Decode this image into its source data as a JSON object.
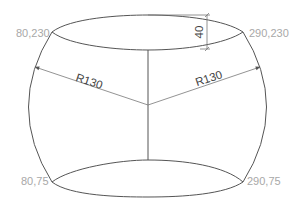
{
  "diagram": {
    "title": "",
    "shape": "barrel",
    "colors": {
      "outline": "#555555",
      "coordinate_label": "#a8a8a8",
      "dimension_text": "#444444",
      "background": "#ffffff"
    },
    "coordinates": {
      "top_left": "80,230",
      "top_right": "290,230",
      "bottom_left": "80,75",
      "bottom_right": "290,75"
    },
    "dimensions": {
      "left_radius": "R130",
      "right_radius": "R130",
      "top_ellipse_height": "40"
    },
    "icons": {
      "arrow_left": "arrowhead-icon",
      "arrow_right": "arrowhead-icon"
    }
  }
}
